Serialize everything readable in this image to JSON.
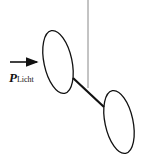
{
  "diagram": {
    "type": "physics-sketch",
    "label": {
      "symbol": "P",
      "subscript": "Licht"
    },
    "colors": {
      "stroke": "#111111",
      "thread": "#888888",
      "background": "#ffffff"
    },
    "elements": {
      "thread": {
        "x": 88,
        "y1": 0,
        "y2": 88
      },
      "left_disk": {
        "cx": 58,
        "cy": 62,
        "rx": 14,
        "ry": 32,
        "rotate": -12
      },
      "right_disk": {
        "cx": 119,
        "cy": 122,
        "rx": 14,
        "ry": 32,
        "rotate": -12
      },
      "rod": {
        "x1": 73,
        "y1": 78,
        "x2": 104,
        "y2": 107
      },
      "arrow": {
        "x1": 10,
        "y1": 62,
        "x2": 37,
        "y2": 62
      }
    }
  }
}
